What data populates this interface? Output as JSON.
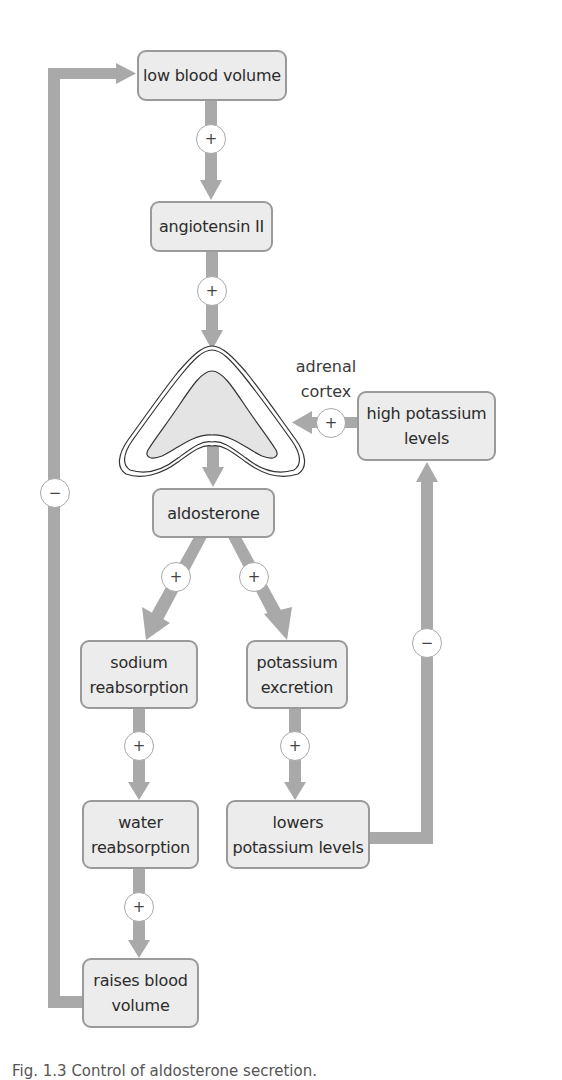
{
  "diagram": {
    "colors": {
      "arrow": "#a9a9a9",
      "box_fill": "#ececec",
      "box_border": "#9a9a9a",
      "gland_fill": "#e4e4e4",
      "gland_line": "#333333"
    },
    "nodes": {
      "low_blood_volume": {
        "lines": [
          "low blood volume"
        ]
      },
      "angiotensin_ii": {
        "lines": [
          "angiotensin II"
        ]
      },
      "adrenal_cortex": {
        "lines": [
          "adrenal",
          "cortex"
        ]
      },
      "high_potassium_levels": {
        "lines": [
          "high potassium",
          "levels"
        ]
      },
      "aldosterone": {
        "lines": [
          "aldosterone"
        ]
      },
      "sodium_reabsorption": {
        "lines": [
          "sodium",
          "reabsorption"
        ]
      },
      "potassium_excretion": {
        "lines": [
          "potassium",
          "excretion"
        ]
      },
      "water_reabsorption": {
        "lines": [
          "water",
          "reabsorption"
        ]
      },
      "lowers_potassium_levels": {
        "lines": [
          "lowers",
          "potassium levels"
        ]
      },
      "raises_blood_volume": {
        "lines": [
          "raises blood",
          "volume"
        ]
      }
    },
    "edges": [
      {
        "from": "low blood volume",
        "to": "angiotensin II",
        "sign": "+"
      },
      {
        "from": "angiotensin II",
        "to": "adrenal cortex",
        "sign": "+"
      },
      {
        "from": "high potassium levels",
        "to": "adrenal cortex",
        "sign": "+"
      },
      {
        "from": "adrenal cortex",
        "to": "aldosterone",
        "sign": ""
      },
      {
        "from": "aldosterone",
        "to": "sodium reabsorption",
        "sign": "+"
      },
      {
        "from": "aldosterone",
        "to": "potassium excretion",
        "sign": "+"
      },
      {
        "from": "sodium reabsorption",
        "to": "water reabsorption",
        "sign": "+"
      },
      {
        "from": "potassium excretion",
        "to": "lowers potassium levels",
        "sign": "+"
      },
      {
        "from": "water reabsorption",
        "to": "raises blood volume",
        "sign": "+"
      },
      {
        "from": "raises blood volume",
        "to": "low blood volume",
        "sign": "−"
      },
      {
        "from": "lowers potassium levels",
        "to": "high potassium levels",
        "sign": "−"
      }
    ],
    "signs": {
      "plus": "+",
      "minus": "−"
    },
    "caption": "Fig. 1.3  Control of aldosterone secretion."
  }
}
